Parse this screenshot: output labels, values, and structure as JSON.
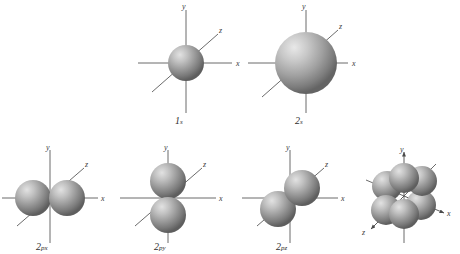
{
  "figure": {
    "background_color": "#ffffff",
    "sphere_color": "#8e8e8e",
    "sphere_highlight_color": "#d8d8d8",
    "sphere_shadow_color": "#4a4a4a",
    "axis_color": "#5a5a5a",
    "label_color": "#2e2e2e"
  },
  "axis_labels": {
    "x": "x",
    "y": "y",
    "z": "z"
  },
  "orbitals": [
    {
      "id": "1s",
      "label_main": "1",
      "label_sub": "s",
      "label_full": "1s",
      "type": "sphere",
      "lobes": 1,
      "radius": 18,
      "center_x": 186,
      "center_y": 63,
      "axes": [
        "x",
        "y",
        "z"
      ],
      "arrow_axes": false
    },
    {
      "id": "2s",
      "label_main": "2",
      "label_sub": "s",
      "label_full": "2s",
      "type": "sphere",
      "lobes": 1,
      "radius": 31,
      "center_x": 306,
      "center_y": 63,
      "axes": [
        "x",
        "y",
        "z"
      ],
      "arrow_axes": false
    },
    {
      "id": "2px",
      "label_main": "2",
      "label_sub": "px",
      "label_full": "2px",
      "type": "dumbbell",
      "lobes": 2,
      "orientation": "x",
      "radius": 18,
      "center_x": 50,
      "center_y": 198,
      "axes": [
        "x",
        "y",
        "z"
      ],
      "arrow_axes": false
    },
    {
      "id": "2py",
      "label_main": "2",
      "label_sub": "py",
      "label_full": "2py",
      "type": "dumbbell",
      "lobes": 2,
      "orientation": "y",
      "radius": 18,
      "center_x": 168,
      "center_y": 198,
      "axes": [
        "x",
        "y",
        "z"
      ],
      "arrow_axes": false
    },
    {
      "id": "2pz",
      "label_main": "2",
      "label_sub": "pz",
      "label_full": "2pz",
      "type": "dumbbell",
      "lobes": 2,
      "orientation": "z",
      "radius": 18,
      "center_x": 290,
      "center_y": 198,
      "axes": [
        "x",
        "y",
        "z"
      ],
      "arrow_axes": false
    },
    {
      "id": "2p-combined",
      "label_main": "",
      "label_sub": "",
      "label_full": "",
      "type": "combined",
      "lobes": 6,
      "radius": 16,
      "center_x": 404,
      "center_y": 196,
      "axes": [
        "x",
        "y",
        "z"
      ],
      "arrow_axes": true
    }
  ]
}
